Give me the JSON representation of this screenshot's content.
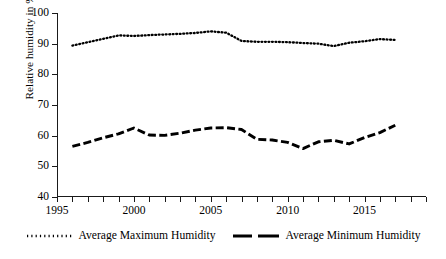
{
  "chart_data": {
    "type": "line",
    "title": "",
    "subtitle": "",
    "xlabel": "",
    "ylabel": "Relative humidity in %",
    "xlim": [
      1995,
      2019
    ],
    "ylim": [
      40,
      100
    ],
    "grid": false,
    "legend_position": "bottom",
    "x_tick_labels": [
      "1995",
      "2000",
      "2005",
      "2010",
      "2015"
    ],
    "x_tick_values": [
      1995,
      2000,
      2005,
      2010,
      2015
    ],
    "x_minor_ticks_every": 1,
    "y_tick_labels": [
      "40",
      "50",
      "60",
      "70",
      "80",
      "90",
      "100"
    ],
    "y_tick_values": [
      40,
      50,
      60,
      70,
      80,
      90,
      100
    ],
    "x": [
      1996,
      1997,
      1998,
      1999,
      2000,
      2001,
      2002,
      2003,
      2004,
      2005,
      2006,
      2007,
      2008,
      2009,
      2010,
      2011,
      2012,
      2013,
      2014,
      2015,
      2016,
      2017
    ],
    "series": [
      {
        "name": "Average Maximum Humidity",
        "style": "dotted",
        "color": "#000000",
        "values": [
          89.4,
          90.5,
          91.6,
          92.7,
          92.5,
          92.8,
          93.0,
          93.2,
          93.5,
          94.0,
          93.6,
          90.9,
          90.6,
          90.6,
          90.5,
          90.2,
          90.0,
          89.2,
          90.3,
          90.8,
          91.5,
          91.2
        ]
      },
      {
        "name": "Average Minimum Humidity",
        "style": "dashed",
        "color": "#000000",
        "values": [
          56.5,
          57.8,
          59.3,
          60.6,
          62.5,
          60.2,
          60.1,
          60.8,
          61.8,
          62.5,
          62.6,
          62.0,
          58.8,
          58.6,
          57.8,
          55.8,
          58.0,
          58.5,
          57.3,
          59.4,
          61.0,
          63.4
        ]
      }
    ]
  },
  "legend": {
    "entries": [
      {
        "label": "Average Maximum Humidity",
        "marker": "dotted-line-swatch"
      },
      {
        "label": "Average Minimum Humidity",
        "marker": "dashed-line-swatch"
      }
    ]
  }
}
